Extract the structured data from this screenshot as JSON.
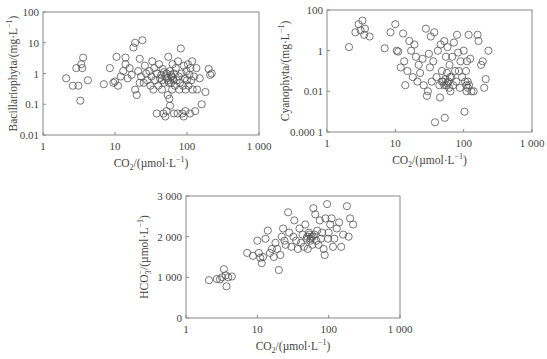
{
  "chart_data": [
    {
      "type": "scatter",
      "title": "",
      "xlabel": "CO2/(µmol·L⁻¹)",
      "ylabel": "Bacillariophyta/(mg·L⁻¹)",
      "xscale": "log",
      "yscale": "log",
      "xlim": [
        1,
        1000
      ],
      "ylim": [
        0.01,
        100
      ],
      "xticks": [
        "1",
        "10",
        "100",
        "1 000"
      ],
      "yticks": [
        "0.01",
        "0.1",
        "1",
        "10",
        "100"
      ],
      "grid": false,
      "frame": {
        "left": 43,
        "right": 259,
        "top": 12,
        "bottom": 135
      },
      "points": [
        [
          2.1,
          0.7
        ],
        [
          2.6,
          0.4
        ],
        [
          2.9,
          1.5
        ],
        [
          3.1,
          0.4
        ],
        [
          3.3,
          0.13
        ],
        [
          3.4,
          2.0
        ],
        [
          3.5,
          1.5
        ],
        [
          3.6,
          3.3
        ],
        [
          4.2,
          0.6
        ],
        [
          7,
          0.45
        ],
        [
          8.5,
          1.5
        ],
        [
          9.5,
          0.5
        ],
        [
          10,
          0.55
        ],
        [
          10.5,
          3.5
        ],
        [
          11,
          0.4
        ],
        [
          12,
          0.8
        ],
        [
          13,
          1.2
        ],
        [
          14,
          3.3
        ],
        [
          14,
          2.0
        ],
        [
          15,
          0.7
        ],
        [
          16,
          1.5
        ],
        [
          17,
          0.9
        ],
        [
          18,
          7
        ],
        [
          19,
          10
        ],
        [
          19,
          0.3
        ],
        [
          20,
          0.2
        ],
        [
          21,
          1.2
        ],
        [
          22,
          0.5
        ],
        [
          22,
          3.0
        ],
        [
          23,
          0.8
        ],
        [
          24,
          12
        ],
        [
          25,
          0.5
        ],
        [
          26,
          1.8
        ],
        [
          27,
          1.0
        ],
        [
          28,
          0.6
        ],
        [
          30,
          1.2
        ],
        [
          31,
          0.4
        ],
        [
          32,
          0.8
        ],
        [
          33,
          2.5
        ],
        [
          34,
          0.3
        ],
        [
          35,
          1.5
        ],
        [
          36,
          0.6
        ],
        [
          38,
          0.05
        ],
        [
          38,
          1.0
        ],
        [
          40,
          0.4
        ],
        [
          41,
          2.0
        ],
        [
          42,
          0.7
        ],
        [
          44,
          0.9
        ],
        [
          45,
          0.3
        ],
        [
          46,
          1.4
        ],
        [
          47,
          0.05
        ],
        [
          48,
          0.5
        ],
        [
          50,
          0.04
        ],
        [
          50,
          0.8
        ],
        [
          52,
          0.06
        ],
        [
          52,
          1.0
        ],
        [
          54,
          0.2
        ],
        [
          55,
          3.5
        ],
        [
          55,
          0.6
        ],
        [
          57,
          0.15
        ],
        [
          58,
          1.2
        ],
        [
          58,
          0.09
        ],
        [
          60,
          0.5
        ],
        [
          60,
          0.9
        ],
        [
          62,
          0.3
        ],
        [
          63,
          2.0
        ],
        [
          64,
          0.7
        ],
        [
          66,
          0.05
        ],
        [
          66,
          1.0
        ],
        [
          68,
          0.4
        ],
        [
          70,
          1.5
        ],
        [
          72,
          0.6
        ],
        [
          74,
          0.05
        ],
        [
          75,
          2.5
        ],
        [
          77,
          0.8
        ],
        [
          78,
          0.3
        ],
        [
          80,
          0.5
        ],
        [
          82,
          6.5
        ],
        [
          84,
          1.0
        ],
        [
          86,
          0.05
        ],
        [
          88,
          0.4
        ],
        [
          90,
          0.04
        ],
        [
          90,
          1.8
        ],
        [
          93,
          0.7
        ],
        [
          95,
          0.06
        ],
        [
          96,
          0.3
        ],
        [
          98,
          1.2
        ],
        [
          100,
          0.6
        ],
        [
          103,
          2.0
        ],
        [
          105,
          0.4
        ],
        [
          108,
          0.9
        ],
        [
          110,
          0.05
        ],
        [
          112,
          1.5
        ],
        [
          115,
          0.6
        ],
        [
          118,
          2.5
        ],
        [
          120,
          0.3
        ],
        [
          125,
          0.8
        ],
        [
          130,
          0.06
        ],
        [
          135,
          1.5
        ],
        [
          138,
          0.3
        ],
        [
          150,
          0.7
        ],
        [
          160,
          0.1
        ],
        [
          180,
          0.25
        ],
        [
          200,
          1.4
        ],
        [
          210,
          0.9
        ],
        [
          220,
          1.0
        ],
        [
          45,
          0.6
        ],
        [
          48,
          1.1
        ],
        [
          53,
          0.7
        ],
        [
          56,
          0.5
        ],
        [
          61,
          0.8
        ],
        [
          65,
          0.6
        ]
      ]
    },
    {
      "type": "scatter",
      "title": "",
      "xlabel": "CO2/(µmol·L⁻¹)",
      "ylabel": "Cyanophyta/(mg·L⁻¹)",
      "xscale": "log",
      "yscale": "log",
      "xlim": [
        1,
        1000
      ],
      "ylim": [
        0.0001,
        100
      ],
      "xticks": [
        "1",
        "10",
        "100",
        "1 000"
      ],
      "yticks": [
        "0.000 1",
        "0.01",
        "1",
        "100"
      ],
      "grid": false,
      "frame": {
        "left": 327,
        "right": 532,
        "top": 10,
        "bottom": 132
      },
      "points": [
        [
          2.1,
          1.5
        ],
        [
          2.6,
          8
        ],
        [
          2.9,
          20
        ],
        [
          3.1,
          10
        ],
        [
          3.3,
          30
        ],
        [
          3.5,
          6
        ],
        [
          3.6,
          12
        ],
        [
          4.2,
          5
        ],
        [
          7,
          1.3
        ],
        [
          8.5,
          8
        ],
        [
          10,
          20
        ],
        [
          10.5,
          1
        ],
        [
          11,
          0.9
        ],
        [
          12,
          0.15
        ],
        [
          13,
          7
        ],
        [
          13.5,
          0.3
        ],
        [
          14,
          0.02
        ],
        [
          15,
          0.1
        ],
        [
          16,
          3
        ],
        [
          17,
          1
        ],
        [
          18,
          0.05
        ],
        [
          19,
          2
        ],
        [
          20,
          0.5
        ],
        [
          21,
          0.03
        ],
        [
          22,
          0.2
        ],
        [
          23,
          0.08
        ],
        [
          25,
          0.4
        ],
        [
          26,
          0.02
        ],
        [
          28,
          12
        ],
        [
          29,
          0.006
        ],
        [
          30,
          0.01
        ],
        [
          31,
          0.7
        ],
        [
          32,
          0.15
        ],
        [
          33,
          5
        ],
        [
          34,
          0.03
        ],
        [
          36,
          0.3
        ],
        [
          37,
          8
        ],
        [
          38,
          0.0003
        ],
        [
          40,
          0.05
        ],
        [
          42,
          1
        ],
        [
          44,
          0.02
        ],
        [
          45,
          0.005
        ],
        [
          46,
          2
        ],
        [
          48,
          0.1
        ],
        [
          50,
          0.03
        ],
        [
          52,
          3
        ],
        [
          53,
          0.0005
        ],
        [
          55,
          0.5
        ],
        [
          56,
          0.02
        ],
        [
          57,
          0.08
        ],
        [
          58,
          1.5
        ],
        [
          60,
          0.03
        ],
        [
          62,
          0.2
        ],
        [
          64,
          0.01
        ],
        [
          66,
          0.05
        ],
        [
          68,
          0.5
        ],
        [
          70,
          0.02
        ],
        [
          72,
          2.5
        ],
        [
          75,
          0.1
        ],
        [
          78,
          0.03
        ],
        [
          80,
          6
        ],
        [
          83,
          0.8
        ],
        [
          85,
          0.1
        ],
        [
          88,
          0.015
        ],
        [
          90,
          0.3
        ],
        [
          95,
          0.05
        ],
        [
          100,
          1
        ],
        [
          103,
          0.001
        ],
        [
          105,
          0.03
        ],
        [
          108,
          0.1
        ],
        [
          110,
          0.01
        ],
        [
          112,
          0.3
        ],
        [
          115,
          0.015
        ],
        [
          118,
          6
        ],
        [
          120,
          0.02
        ],
        [
          125,
          0.4
        ],
        [
          130,
          0.01
        ],
        [
          140,
          0.01
        ],
        [
          160,
          6
        ],
        [
          165,
          3
        ],
        [
          180,
          0.2
        ],
        [
          190,
          0.3
        ],
        [
          200,
          0.015
        ],
        [
          210,
          0.04
        ],
        [
          230,
          1
        ],
        [
          48,
          0.03
        ],
        [
          52,
          0.02
        ],
        [
          54,
          0.04
        ],
        [
          58,
          0.025
        ],
        [
          61,
          0.015
        ],
        [
          63,
          0.05
        ],
        [
          110,
          0.02
        ],
        [
          115,
          0.03
        ]
      ]
    },
    {
      "type": "scatter",
      "title": "",
      "xlabel": "CO2/(µmol·L⁻¹)",
      "ylabel": "HCO3⁻/(µmol·L⁻¹)",
      "xscale": "log",
      "yscale": "linear",
      "xlim": [
        1,
        1000
      ],
      "ylim": [
        0,
        3000
      ],
      "xticks": [
        "1",
        "10",
        "100",
        "1 000"
      ],
      "yticks": [
        "0",
        "1 000",
        "2 000",
        "3 000"
      ],
      "grid": false,
      "frame": {
        "left": 186,
        "right": 400,
        "top": 196,
        "bottom": 318
      },
      "points": [
        [
          2.1,
          930
        ],
        [
          2.7,
          960
        ],
        [
          3.0,
          950
        ],
        [
          3.2,
          1000
        ],
        [
          3.4,
          1200
        ],
        [
          3.6,
          1050
        ],
        [
          3.7,
          780
        ],
        [
          3.9,
          1000
        ],
        [
          4.4,
          1020
        ],
        [
          7.2,
          1600
        ],
        [
          8.7,
          1530
        ],
        [
          10,
          1900
        ],
        [
          10.5,
          1600
        ],
        [
          11,
          1480
        ],
        [
          11.5,
          1350
        ],
        [
          12,
          1500
        ],
        [
          13,
          1950
        ],
        [
          14,
          2150
        ],
        [
          15,
          1600
        ],
        [
          16,
          1700
        ],
        [
          17,
          1500
        ],
        [
          18,
          1850
        ],
        [
          19,
          1700
        ],
        [
          20,
          1180
        ],
        [
          21,
          1550
        ],
        [
          22,
          2000
        ],
        [
          23,
          2200
        ],
        [
          24,
          1900
        ],
        [
          25,
          1800
        ],
        [
          27,
          2600
        ],
        [
          28,
          2100
        ],
        [
          30,
          1750
        ],
        [
          32,
          2000
        ],
        [
          33,
          2400
        ],
        [
          35,
          1900
        ],
        [
          37,
          1700
        ],
        [
          39,
          2200
        ],
        [
          41,
          1850
        ],
        [
          43,
          2050
        ],
        [
          45,
          1750
        ],
        [
          47,
          2300
        ],
        [
          49,
          1950
        ],
        [
          51,
          1700
        ],
        [
          53,
          2100
        ],
        [
          55,
          1900
        ],
        [
          57,
          2000
        ],
        [
          59,
          1800
        ],
        [
          61,
          2700
        ],
        [
          63,
          2050
        ],
        [
          65,
          2550
        ],
        [
          67,
          1900
        ],
        [
          69,
          2150
        ],
        [
          72,
          1800
        ],
        [
          75,
          2400
        ],
        [
          78,
          1950
        ],
        [
          81,
          2100
        ],
        [
          85,
          1700
        ],
        [
          88,
          1550
        ],
        [
          90,
          2450
        ],
        [
          95,
          2800
        ],
        [
          98,
          1950
        ],
        [
          100,
          2100
        ],
        [
          105,
          2300
        ],
        [
          110,
          2450
        ],
        [
          115,
          1750
        ],
        [
          120,
          1950
        ],
        [
          130,
          2200
        ],
        [
          140,
          2350
        ],
        [
          150,
          1750
        ],
        [
          160,
          2050
        ],
        [
          180,
          2750
        ],
        [
          190,
          2000
        ],
        [
          200,
          2450
        ],
        [
          220,
          2300
        ],
        [
          50,
          2000
        ],
        [
          54,
          2050
        ],
        [
          56,
          1950
        ],
        [
          60,
          2000
        ]
      ]
    }
  ]
}
